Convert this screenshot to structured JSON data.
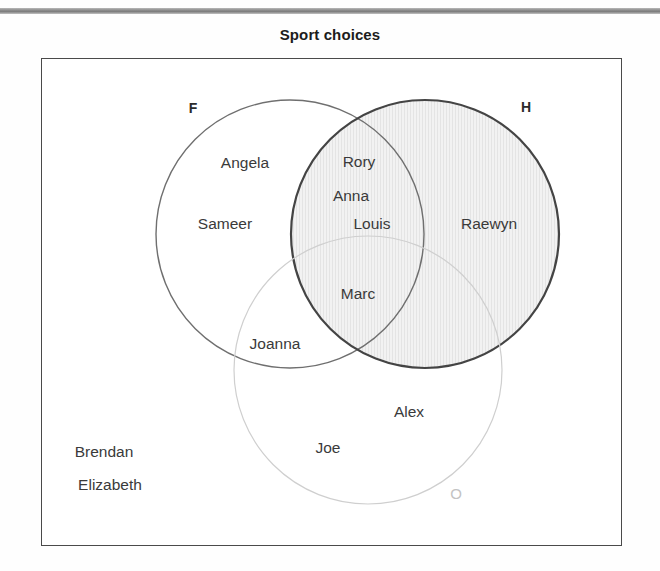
{
  "figure": {
    "title": "Sport choices",
    "top_rule_color": "#8e8e8e",
    "frame_border_color": "#4a4a4a",
    "background": "#ffffff"
  },
  "venn": {
    "type": "three-set-venn",
    "sets": [
      {
        "key": "F",
        "label": "F",
        "label_x": 193,
        "label_y": 108,
        "label_style": "dark",
        "cx": 290,
        "cy": 234,
        "r": 134,
        "stroke": "#6f6f6f",
        "stroke_width": 1.4,
        "fill": "none"
      },
      {
        "key": "H",
        "label": "H",
        "label_x": 526,
        "label_y": 107,
        "label_style": "dark",
        "cx": 425,
        "cy": 234,
        "r": 134,
        "stroke": "#444444",
        "stroke_width": 2.2,
        "fill": "hatch"
      },
      {
        "key": "O",
        "label": "O",
        "label_x": 456,
        "label_y": 493,
        "label_style": "faint",
        "cx": 368,
        "cy": 370,
        "r": 134,
        "stroke": "#cfcfcf",
        "stroke_width": 1.2,
        "fill": "none"
      }
    ],
    "members": [
      {
        "name": "Angela",
        "region": "F only",
        "x": 245,
        "y": 163
      },
      {
        "name": "Sameer",
        "region": "F only",
        "x": 225,
        "y": 224
      },
      {
        "name": "Rory",
        "region": "F and H",
        "x": 359,
        "y": 162
      },
      {
        "name": "Anna",
        "region": "F and H",
        "x": 351,
        "y": 196
      },
      {
        "name": "Louis",
        "region": "F and H",
        "x": 372,
        "y": 224
      },
      {
        "name": "Raewyn",
        "region": "H only",
        "x": 489,
        "y": 224
      },
      {
        "name": "Marc",
        "region": "F and H and O",
        "x": 358,
        "y": 294
      },
      {
        "name": "Joanna",
        "region": "F and O",
        "x": 275,
        "y": 344
      },
      {
        "name": "Alex",
        "region": "O only",
        "x": 409,
        "y": 412
      },
      {
        "name": "Joe",
        "region": "O only",
        "x": 328,
        "y": 448
      },
      {
        "name": "Brendan",
        "region": "outside",
        "x": 104,
        "y": 452
      },
      {
        "name": "Elizabeth",
        "region": "outside",
        "x": 110,
        "y": 485
      }
    ],
    "region_summary": {
      "F_only": [
        "Angela",
        "Sameer"
      ],
      "H_only": [
        "Raewyn"
      ],
      "O_only": [
        "Alex",
        "Joe"
      ],
      "F_and_H": [
        "Rory",
        "Anna",
        "Louis"
      ],
      "F_and_O": [
        "Joanna"
      ],
      "H_and_O": [],
      "F_and_H_and_O": [
        "Marc"
      ],
      "outside": [
        "Brendan",
        "Elizabeth"
      ]
    }
  }
}
